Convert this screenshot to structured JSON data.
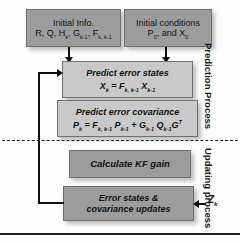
{
  "figure": {
    "boxes": {
      "initial_info": {
        "line1": "Initial Info.",
        "line2_html": "R, Q, Hₖ, Gₖ₋₁, Fₖ, ₖ₋₁"
      },
      "initial_conditions": {
        "line1": "Initial conditions",
        "line2_html": "P₀, and X₀"
      },
      "predict_error_states": {
        "title": "Predict error states",
        "equation": "Xₖ = Fₖ, ₖ₋₁ Xₖ₋₁"
      },
      "predict_error_covariance": {
        "title": "Predict error covariance",
        "equation": "Pₖ = Fₖ, ₖ₋₁ Pₖ₋₁ + Gₖ₋₁ Qₖ₋₁ Gᵀ"
      },
      "calculate_kf_gain": {
        "title": "Calculate KF gain"
      },
      "error_states_updates": {
        "line1": "Error states &",
        "line2": "covariance  updates"
      }
    },
    "labels": {
      "prediction_process": "Prediction Process",
      "updating_process": "Updating process",
      "measurement_input": "Zₖ"
    },
    "colors": {
      "box_dark": "#9c9c9c",
      "box_light": "#c9c9c9",
      "connector": "#0e0e0e",
      "divider": "#1a1a1a",
      "text": "#111111",
      "background": "#fdfdfd"
    }
  }
}
